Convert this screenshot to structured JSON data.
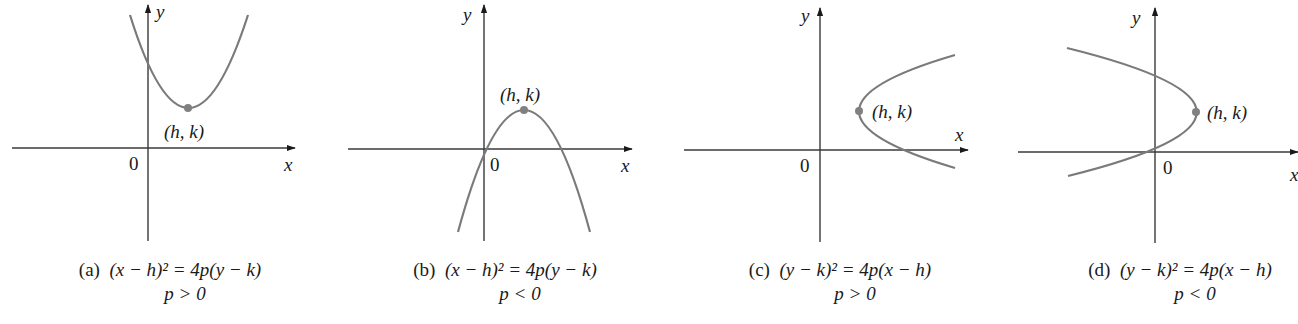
{
  "figure": {
    "panels": [
      {
        "id": "a",
        "tag": "(a)",
        "equation": "(x − h)² = 4p(y − k)",
        "condition": "p > 0",
        "orientation": "opens upward",
        "vertex_label": "(h, k)",
        "origin_label": "0",
        "x_axis_label": "x",
        "y_axis_label": "y"
      },
      {
        "id": "b",
        "tag": "(b)",
        "equation": "(x − h)² = 4p(y − k)",
        "condition": "p < 0",
        "orientation": "opens downward",
        "vertex_label": "(h, k)",
        "origin_label": "0",
        "x_axis_label": "x",
        "y_axis_label": "y"
      },
      {
        "id": "c",
        "tag": "(c)",
        "equation": "(y − k)² = 4p(x − h)",
        "condition": "p > 0",
        "orientation": "opens right",
        "vertex_label": "(h, k)",
        "origin_label": "0",
        "x_axis_label": "x",
        "y_axis_label": "y"
      },
      {
        "id": "d",
        "tag": "(d)",
        "equation": "(y − k)² = 4p(x − h)",
        "condition": "p < 0",
        "orientation": "opens left",
        "vertex_label": "(h, k)",
        "origin_label": "0",
        "x_axis_label": "x",
        "y_axis_label": "y"
      }
    ],
    "colors": {
      "axis": "#3a3a3a",
      "curve": "#7a7a7a",
      "vertex_dot": "#808080",
      "text": "#1a1a1a",
      "background": "#ffffff"
    }
  }
}
